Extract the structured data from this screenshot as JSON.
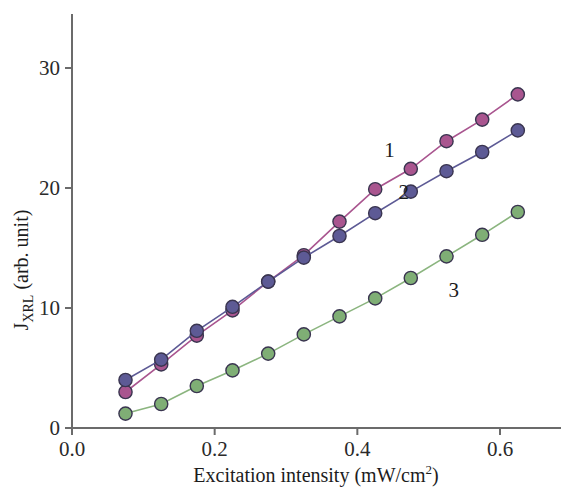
{
  "chart_data": {
    "type": "line",
    "title": "",
    "xlabel": "Excitation intensity (mW/cm",
    "xlabel_sup": "2",
    "xlabel_tail": ")",
    "ylabel_main": "J",
    "ylabel_sub": "XRL",
    "ylabel_tail": " (arb. unit)",
    "xlim": [
      0.0,
      0.68
    ],
    "ylim": [
      0,
      34
    ],
    "xticks": [
      0.0,
      0.2,
      0.4,
      0.6
    ],
    "xtick_labels": [
      "0.0",
      "0.2",
      "0.4",
      "0.6"
    ],
    "yticks": [
      0,
      10,
      20,
      30
    ],
    "ytick_labels": [
      "0",
      "10",
      "20",
      "30"
    ],
    "grid": false,
    "legend_position": "inline-annotations",
    "series": [
      {
        "name": "1",
        "color": "#a9558f",
        "line_color": "#a9558f",
        "marker": "circle",
        "label_x": 0.445,
        "label_y": 22.6,
        "x": [
          0.075,
          0.125,
          0.175,
          0.225,
          0.275,
          0.325,
          0.375,
          0.425,
          0.475,
          0.525,
          0.575,
          0.625
        ],
        "y": [
          3.0,
          5.3,
          7.7,
          9.8,
          12.2,
          14.4,
          17.2,
          19.9,
          21.6,
          23.9,
          25.7,
          27.8
        ]
      },
      {
        "name": "2",
        "color": "#5d5a95",
        "line_color": "#5d5a95",
        "marker": "circle",
        "label_x": 0.465,
        "label_y": 19.1,
        "x": [
          0.075,
          0.125,
          0.175,
          0.225,
          0.275,
          0.325,
          0.375,
          0.425,
          0.475,
          0.525,
          0.575,
          0.625
        ],
        "y": [
          4.0,
          5.7,
          8.1,
          10.1,
          12.2,
          14.2,
          16.0,
          17.9,
          19.7,
          21.4,
          23.0,
          24.8
        ]
      },
      {
        "name": "3",
        "color": "#7fae75",
        "line_color": "#8bb57f",
        "marker": "circle",
        "label_x": 0.535,
        "label_y": 10.9,
        "x": [
          0.075,
          0.125,
          0.175,
          0.225,
          0.275,
          0.325,
          0.375,
          0.425,
          0.475,
          0.525,
          0.575,
          0.625
        ],
        "y": [
          1.2,
          2.0,
          3.5,
          4.8,
          6.2,
          7.8,
          9.3,
          10.8,
          12.5,
          14.3,
          16.1,
          18.0
        ]
      }
    ]
  }
}
